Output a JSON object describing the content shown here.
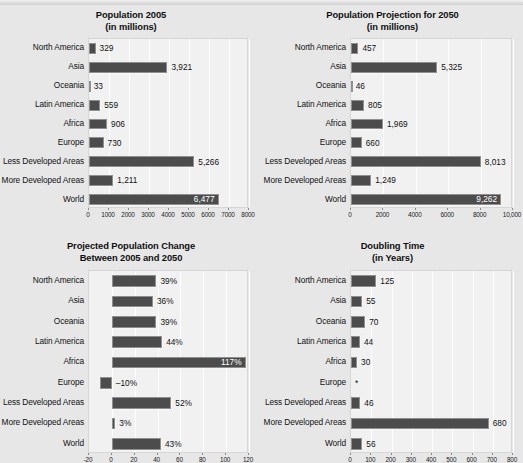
{
  "page": {
    "background": "#e7e7e7",
    "bar_color": "#4c4c4c",
    "plot_background": "#f1f1f1",
    "gridline_color": "#ffffff"
  },
  "chart_data": [
    {
      "id": "population-2005",
      "type": "bar",
      "orientation": "horizontal",
      "title": "Population 2005",
      "subtitle": "(in millions)",
      "xlabel": "",
      "ylabel": "",
      "xlim": [
        0,
        8000
      ],
      "ticks": [
        0,
        1000,
        2000,
        3000,
        4000,
        5000,
        6000,
        7000,
        8000
      ],
      "tick_labels": [
        "0",
        "1000",
        "2000",
        "3000",
        "4000",
        "5000",
        "6000",
        "7000",
        "8000"
      ],
      "grid": true,
      "legend": "none",
      "categories": [
        "North America",
        "Asia",
        "Oceania",
        "Latin America",
        "Africa",
        "Europe",
        "Less Developed Areas",
        "More Developed Areas",
        "World"
      ],
      "values": [
        329,
        3921,
        33,
        559,
        906,
        730,
        5266,
        1211,
        6477
      ],
      "value_labels": [
        "329",
        "3,921",
        "33",
        "559",
        "906",
        "730",
        "5,266",
        "1,211",
        "6,477"
      ],
      "label_inside": [
        false,
        false,
        false,
        false,
        false,
        false,
        false,
        false,
        true
      ]
    },
    {
      "id": "population-projection-2050",
      "type": "bar",
      "orientation": "horizontal",
      "title": "Population Projection for 2050",
      "subtitle": "(in millions)",
      "xlabel": "",
      "ylabel": "",
      "xlim": [
        0,
        10000
      ],
      "ticks": [
        0,
        2000,
        4000,
        6000,
        8000,
        10000
      ],
      "tick_labels": [
        "0",
        "2000",
        "4000",
        "6000",
        "8000",
        "10,000"
      ],
      "grid": true,
      "legend": "none",
      "categories": [
        "North America",
        "Asia",
        "Oceania",
        "Latin America",
        "Africa",
        "Europe",
        "Less Developed Areas",
        "More Developed Areas",
        "World"
      ],
      "values": [
        457,
        5325,
        46,
        805,
        1969,
        660,
        8013,
        1249,
        9262
      ],
      "value_labels": [
        "457",
        "5,325",
        "46",
        "805",
        "1,969",
        "660",
        "8,013",
        "1,249",
        "9,262"
      ],
      "label_inside": [
        false,
        false,
        false,
        false,
        false,
        false,
        false,
        false,
        true
      ]
    },
    {
      "id": "projected-population-change",
      "type": "bar",
      "orientation": "horizontal",
      "title": "Projected Population Change",
      "subtitle": "Between 2005 and 2050",
      "xlabel": "",
      "ylabel": "",
      "xlim": [
        -20,
        120
      ],
      "ticks": [
        -20,
        0,
        20,
        40,
        60,
        80,
        100,
        120
      ],
      "tick_labels": [
        "-20",
        "0",
        "20",
        "40",
        "60",
        "80",
        "100",
        "120"
      ],
      "grid": true,
      "legend": "none",
      "categories": [
        "North America",
        "Asia",
        "Oceania",
        "Latin America",
        "Africa",
        "Europe",
        "Less Developed Areas",
        "More Developed Areas",
        "World"
      ],
      "values": [
        39,
        36,
        39,
        44,
        117,
        -10,
        52,
        3,
        43
      ],
      "value_labels": [
        "39%",
        "36%",
        "39%",
        "44%",
        "117%",
        "–10%",
        "52%",
        "3%",
        "43%"
      ],
      "label_inside": [
        false,
        false,
        false,
        false,
        true,
        false,
        false,
        false,
        false
      ]
    },
    {
      "id": "doubling-time",
      "type": "bar",
      "orientation": "horizontal",
      "title": "Doubling Time",
      "subtitle": "(in Years)",
      "xlabel": "",
      "ylabel": "",
      "xlim": [
        0,
        800
      ],
      "ticks": [
        0,
        100,
        200,
        300,
        400,
        500,
        600,
        700,
        800
      ],
      "tick_labels": [
        "0",
        "100",
        "200",
        "300",
        "400",
        "500",
        "600",
        "700",
        "800"
      ],
      "grid": true,
      "legend": "none",
      "categories": [
        "North America",
        "Asia",
        "Oceania",
        "Latin America",
        "Africa",
        "Europe",
        "Less Developed Areas",
        "More Developed Areas",
        "World"
      ],
      "values": [
        125,
        55,
        70,
        44,
        30,
        null,
        46,
        680,
        56
      ],
      "value_labels": [
        "125",
        "55",
        "70",
        "44",
        "30",
        "*",
        "46",
        "680",
        "56"
      ],
      "label_inside": [
        false,
        false,
        false,
        false,
        false,
        false,
        false,
        false,
        false
      ]
    }
  ]
}
